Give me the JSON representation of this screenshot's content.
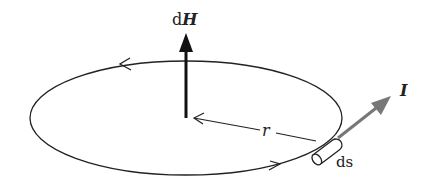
{
  "diagram": {
    "type": "physics-figure",
    "labels": {
      "dH_prefix": "d",
      "dH_symbol": "H",
      "r": "r",
      "ds": "ds",
      "I": "I"
    },
    "colors": {
      "stroke": "#222222",
      "current_arrow": "#777777",
      "background": "#ffffff"
    },
    "loop": {
      "cx": 186,
      "cy": 118,
      "rx": 156,
      "ry": 57
    },
    "elements": [
      {
        "name": "current-loop",
        "direction": "counter-clockwise (viewed from above)"
      },
      {
        "name": "field-vector-dH",
        "direction": "up"
      },
      {
        "name": "radius-r",
        "from": "center",
        "to": "ds"
      },
      {
        "name": "current-element-ds"
      },
      {
        "name": "current-vector-I",
        "direction": "up-right, tangent"
      }
    ]
  }
}
